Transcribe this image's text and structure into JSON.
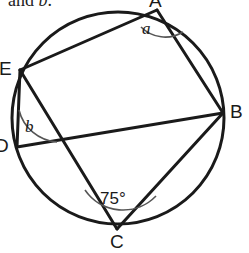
{
  "figure": {
    "prompt_prefix": "and ",
    "prompt_var": "b",
    "prompt_suffix": ".",
    "stroke_color": "#1a1a1a",
    "fill_color": "#ffffff",
    "circle": {
      "cx": 118,
      "cy": 118,
      "r": 106
    },
    "vertices": [
      {
        "id": "A",
        "label": "A",
        "x": 157,
        "y": 10
      },
      {
        "id": "B",
        "label": "B",
        "x": 223,
        "y": 113
      },
      {
        "id": "C",
        "label": "C",
        "x": 117,
        "y": 229
      },
      {
        "id": "D",
        "label": "D",
        "x": 17,
        "y": 147
      },
      {
        "id": "E",
        "label": "E",
        "x": 20,
        "y": 70
      }
    ],
    "chords": [
      {
        "from": "E",
        "to": "A"
      },
      {
        "from": "A",
        "to": "B"
      },
      {
        "from": "E",
        "to": "C"
      },
      {
        "from": "E",
        "to": "D"
      },
      {
        "from": "D",
        "to": "B"
      },
      {
        "from": "C",
        "to": "B"
      }
    ],
    "angles": [
      {
        "id": "a",
        "label": "a",
        "vertex": "A",
        "kind": "variable"
      },
      {
        "id": "b",
        "label": "b",
        "vertex": "E",
        "kind": "variable"
      },
      {
        "id": "c",
        "label": "75°",
        "vertex": "C",
        "kind": "value"
      }
    ]
  }
}
